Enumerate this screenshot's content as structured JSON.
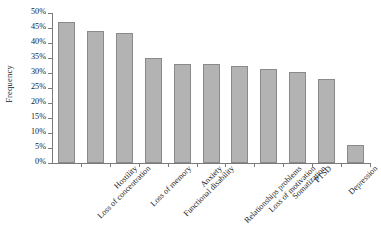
{
  "chart_data": {
    "type": "bar",
    "title": "",
    "xlabel": "",
    "ylabel": "Frequency",
    "ylim": [
      0,
      50
    ],
    "ytick_step": 5,
    "ytick_labels": [
      "50%",
      "45%",
      "40%",
      "35%",
      "30%",
      "25%",
      "20%",
      "15%",
      "10%",
      "5%",
      "0%"
    ],
    "ytick_values": [
      50,
      45,
      40,
      35,
      30,
      25,
      20,
      15,
      10,
      5,
      0
    ],
    "grid": false,
    "legend": false,
    "categories": [
      "Loss of concentration",
      "Hostility",
      "Loss of memory",
      "Functional disability",
      "Anxiety",
      "Relationships problems",
      "Loss of motivation",
      "Somatization",
      "PTSD",
      "Depression",
      "Alcohol & drug abuse"
    ],
    "values": [
      47,
      44,
      43.5,
      35,
      33,
      33,
      32.5,
      31.5,
      30.5,
      28,
      6
    ],
    "bar_color": "#b3b3b3",
    "bar_border_color": "#8a8a8a",
    "axis_color": "#7a7a7a",
    "text_color": "#1a1a1a"
  }
}
